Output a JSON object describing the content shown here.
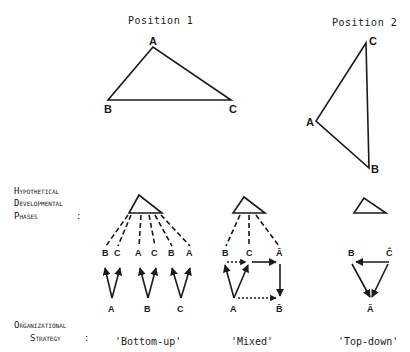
{
  "position1": {
    "title": "Position 1",
    "vertices": {
      "a": "A",
      "b": "B",
      "c": "C"
    }
  },
  "position2": {
    "title": "Position 2",
    "vertices": {
      "a": "A",
      "b": "B",
      "c": "C"
    }
  },
  "left_labels": {
    "phases_1": "Hypothetical",
    "phases_2": "Developmental",
    "phases_3": "Phases",
    "phases_colon": ":",
    "strategy_1": "Organizational",
    "strategy_2": "Strategy",
    "strategy_colon": ":"
  },
  "strategies": {
    "bottom_up": {
      "label": "'Bottom-up'",
      "top_nodes": [
        "B",
        "C",
        "A",
        "C",
        "B",
        "A"
      ],
      "bottom_nodes": [
        "A",
        "B",
        "C"
      ]
    },
    "mixed": {
      "label": "'Mixed'",
      "top_nodes": [
        "B",
        "C",
        "Ā"
      ],
      "bottom_nodes": [
        "A",
        "B̄"
      ]
    },
    "top_down": {
      "label": "'Top-down'",
      "top_nodes": [
        "B",
        "Ĉ"
      ],
      "bottom_nodes": [
        "Ā"
      ]
    }
  },
  "marker": "×"
}
